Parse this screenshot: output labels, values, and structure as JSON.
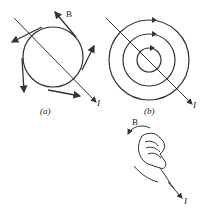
{
  "figure": {
    "panel_a": {
      "caption": "(a)",
      "field_label": "B",
      "current_label": "I",
      "description": "Circle around straight current-carrying wire with tangent B-field arrows"
    },
    "panel_b": {
      "caption": "(b)",
      "current_label": "I",
      "description": "Concentric circular magnetic field lines around wire"
    },
    "right_hand_rule": {
      "field_label": "B",
      "current_label": "I",
      "description": "Right hand grip rule: thumb along current, fingers curl along B"
    },
    "colors": {
      "line": "#333333",
      "background": "#ffffff"
    }
  }
}
